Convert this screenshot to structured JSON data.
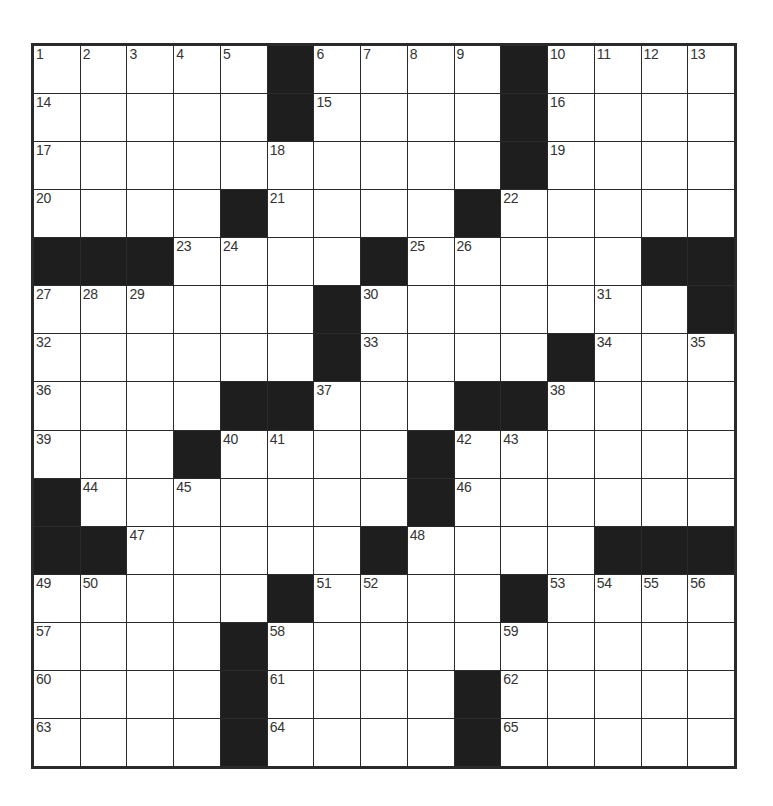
{
  "puzzle": {
    "rows": 15,
    "cols": 15,
    "colors": {
      "block": "#1e1e1e",
      "grid_line": "#2a2a2a",
      "cell": "#ffffff",
      "number": "#333333"
    },
    "grid": [
      [
        "1",
        "2",
        "3",
        "4",
        "5",
        "#",
        "6",
        "7",
        "8",
        "9",
        "#",
        "10",
        "11",
        "12",
        "13"
      ],
      [
        "14",
        "",
        "",
        "",
        "",
        "#",
        "15",
        "",
        "",
        "",
        "#",
        "16",
        "",
        "",
        ""
      ],
      [
        "17",
        "",
        "",
        "",
        "",
        "18",
        "",
        "",
        "",
        "",
        "#",
        "19",
        "",
        "",
        ""
      ],
      [
        "20",
        "",
        "",
        "",
        "#",
        "21",
        "",
        "",
        "",
        "#",
        "22",
        "",
        "",
        "",
        ""
      ],
      [
        "#",
        "#",
        "#",
        "23",
        "24",
        "",
        "",
        "#",
        "25",
        "26",
        "",
        "",
        "",
        "#",
        "#"
      ],
      [
        "27",
        "28",
        "29",
        "",
        "",
        "",
        "#",
        "30",
        "",
        "",
        "",
        "",
        "31",
        "",
        "#"
      ],
      [
        "32",
        "",
        "",
        "",
        "",
        "",
        "#",
        "33",
        "",
        "",
        "",
        "#",
        "34",
        "",
        "35"
      ],
      [
        "36",
        "",
        "",
        "",
        "#",
        "#",
        "37",
        "",
        "",
        "#",
        "#",
        "38",
        "",
        "",
        ""
      ],
      [
        "39",
        "",
        "",
        "#",
        "40",
        "41",
        "",
        "",
        "#",
        "42",
        "43",
        "",
        "",
        "",
        ""
      ],
      [
        "#",
        "44",
        "",
        "45",
        "",
        "",
        "",
        "",
        "#",
        "46",
        "",
        "",
        "",
        "",
        ""
      ],
      [
        "#",
        "#",
        "47",
        "",
        "",
        "",
        "",
        "#",
        "48",
        "",
        "",
        "",
        "#",
        "#",
        "#"
      ],
      [
        "49",
        "50",
        "",
        "",
        "",
        "#",
        "51",
        "52",
        "",
        "",
        "#",
        "53",
        "54",
        "55",
        "56"
      ],
      [
        "57",
        "",
        "",
        "",
        "#",
        "58",
        "",
        "",
        "",
        "",
        "59",
        "",
        "",
        "",
        ""
      ],
      [
        "60",
        "",
        "",
        "",
        "#",
        "61",
        "",
        "",
        "",
        "#",
        "62",
        "",
        "",
        "",
        ""
      ],
      [
        "63",
        "",
        "",
        "",
        "#",
        "64",
        "",
        "",
        "",
        "#",
        "65",
        "",
        "",
        "",
        ""
      ]
    ],
    "letters": [],
    "clue_numbers": [
      "1",
      "2",
      "3",
      "4",
      "5",
      "6",
      "7",
      "8",
      "9",
      "10",
      "11",
      "12",
      "13",
      "14",
      "15",
      "16",
      "17",
      "18",
      "19",
      "20",
      "21",
      "22",
      "23",
      "24",
      "25",
      "26",
      "27",
      "28",
      "29",
      "30",
      "31",
      "32",
      "33",
      "34",
      "35",
      "36",
      "37",
      "38",
      "39",
      "40",
      "41",
      "42",
      "43",
      "44",
      "45",
      "46",
      "47",
      "48",
      "49",
      "50",
      "51",
      "52",
      "53",
      "54",
      "55",
      "56",
      "57",
      "58",
      "59",
      "60",
      "61",
      "62",
      "63",
      "64",
      "65"
    ]
  }
}
